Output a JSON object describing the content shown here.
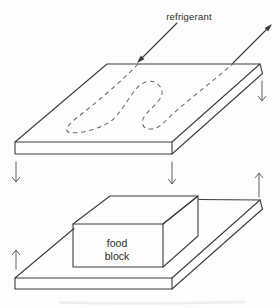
{
  "diagram": {
    "labels": {
      "refrigerant": "refrigerant",
      "food_line1": "food",
      "food_line2": "block"
    },
    "colors": {
      "background": "#fdfdfd",
      "outline": "#3d3d3d",
      "coil_dash": "#6a6a6a",
      "arrow": "#5f5f5f",
      "text": "#2b2b2b",
      "smudge": "#ebebeb"
    },
    "arrows": {
      "refrigerant_inlet": {
        "icon": "arrow-down-left-icon",
        "style": "solid-filled-head",
        "direction": "down-left"
      },
      "refrigerant_outlet": {
        "icon": "arrow-up-right-icon",
        "style": "solid-filled-head",
        "direction": "up-right"
      },
      "plate_side_down": {
        "icon": "arrow-down-icon",
        "direction": "down"
      },
      "gap_left_down": {
        "icon": "arrow-down-icon",
        "direction": "down"
      },
      "gap_middle_down": {
        "icon": "arrow-down-icon",
        "direction": "down"
      },
      "gap_right_up": {
        "icon": "arrow-up-icon",
        "direction": "up"
      },
      "bottom_left_up": {
        "icon": "arrow-up-icon",
        "direction": "up"
      }
    }
  }
}
